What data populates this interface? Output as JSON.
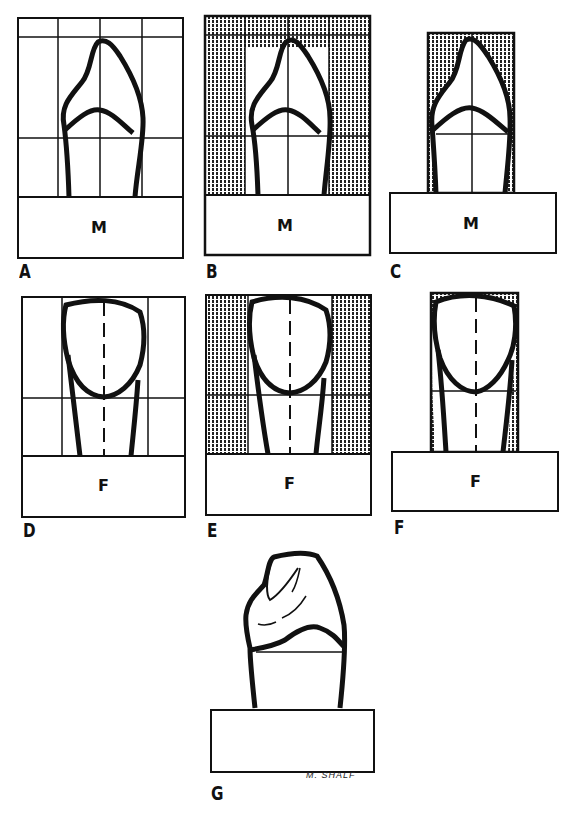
{
  "figure": {
    "panels": [
      {
        "id": "A",
        "label": "A",
        "view": "M",
        "grid": true,
        "shading": "none"
      },
      {
        "id": "B",
        "label": "B",
        "view": "M",
        "grid": true,
        "shading": "outer-columns"
      },
      {
        "id": "C",
        "label": "C",
        "view": "M",
        "grid": true,
        "shading": "outline-excess"
      },
      {
        "id": "D",
        "label": "D",
        "view": "F",
        "grid": true,
        "shading": "none"
      },
      {
        "id": "E",
        "label": "E",
        "view": "F",
        "grid": true,
        "shading": "outer-columns"
      },
      {
        "id": "F",
        "label": "F",
        "view": "F",
        "grid": true,
        "shading": "outline-excess"
      },
      {
        "id": "G",
        "label": "G",
        "view": "",
        "grid": false,
        "shading": "none"
      }
    ],
    "signature": "M. SHALF",
    "colors": {
      "ink": "#111111",
      "paper": "#ffffff"
    }
  }
}
